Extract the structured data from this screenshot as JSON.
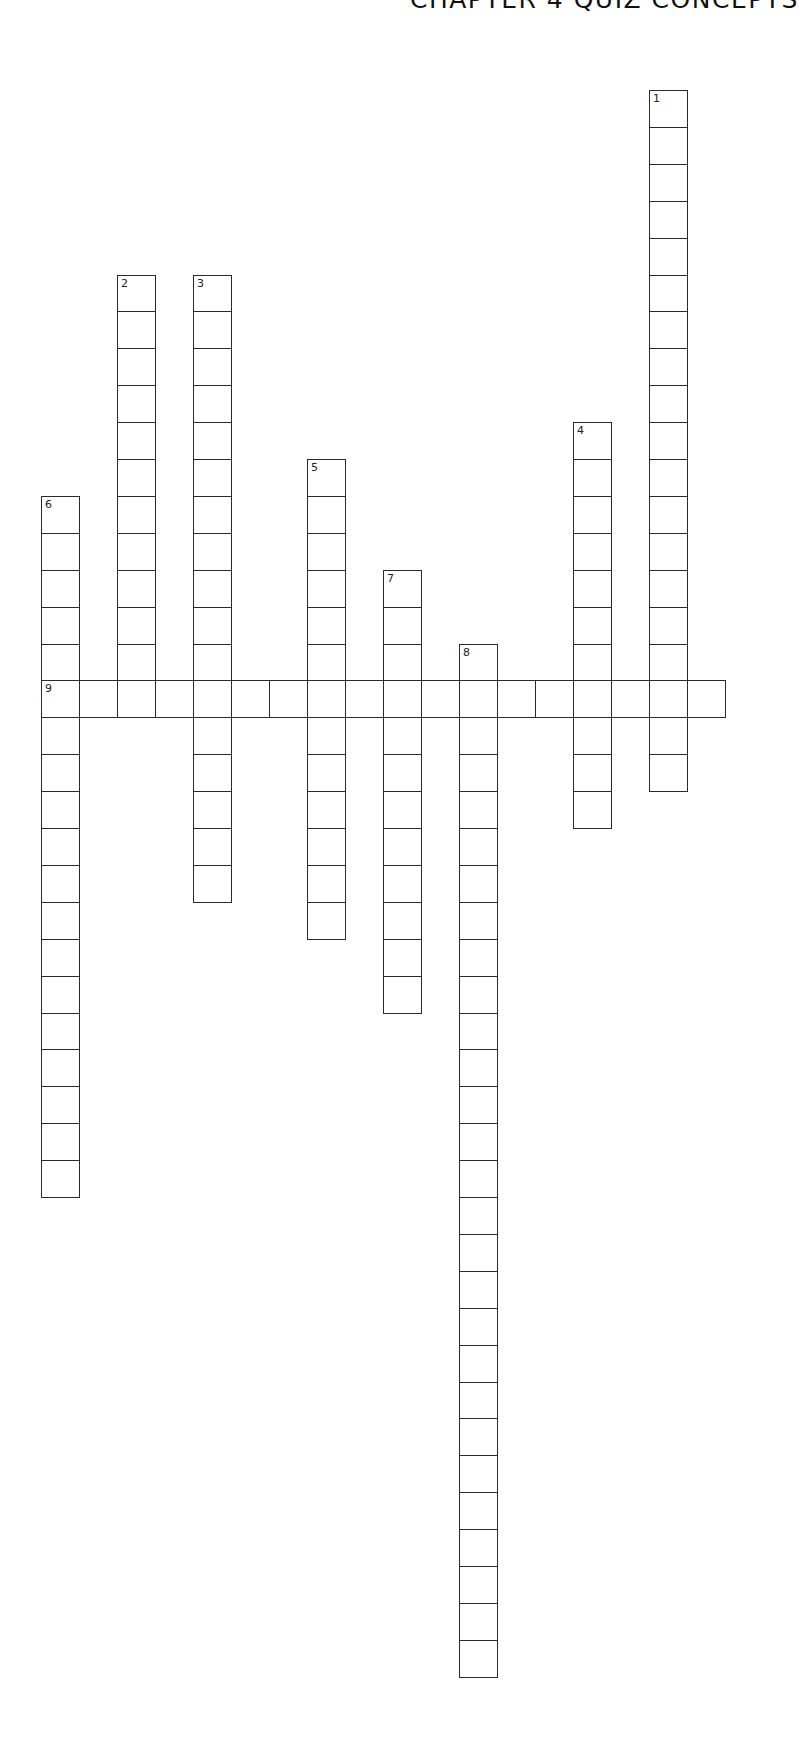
{
  "header": {
    "title": "CHAPTER 4 QUIZ CONCEPTS"
  },
  "crossword": {
    "layout": {
      "origin_x": 41,
      "origin_y": 90,
      "cell_width": 38.0,
      "cell_height": 36.9,
      "border_color": "#2b2b2b"
    },
    "entries": [
      {
        "number": "1",
        "direction": "down",
        "col": 16,
        "row": 0,
        "length": 19
      },
      {
        "number": "2",
        "direction": "down",
        "col": 2,
        "row": 5,
        "length": 12
      },
      {
        "number": "3",
        "direction": "down",
        "col": 4,
        "row": 5,
        "length": 17
      },
      {
        "number": "4",
        "direction": "down",
        "col": 14,
        "row": 9,
        "length": 11
      },
      {
        "number": "5",
        "direction": "down",
        "col": 7,
        "row": 10,
        "length": 13
      },
      {
        "number": "6",
        "direction": "down",
        "col": 0,
        "row": 11,
        "length": 19
      },
      {
        "number": "7",
        "direction": "down",
        "col": 9,
        "row": 13,
        "length": 12
      },
      {
        "number": "8",
        "direction": "down",
        "col": 11,
        "row": 15,
        "length": 28
      },
      {
        "number": "9",
        "direction": "across",
        "col": 0,
        "row": 16,
        "length": 18
      }
    ]
  }
}
